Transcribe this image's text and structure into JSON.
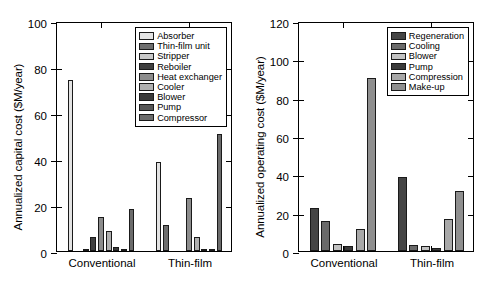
{
  "figure": {
    "panels": [
      "capital",
      "operating"
    ],
    "background": "#ffffff",
    "axis_color": "#000000"
  },
  "chart_data": [
    {
      "id": "capital",
      "type": "bar",
      "title": "",
      "xlabel": "",
      "ylabel": "Annualized capital cost ($M/year)",
      "ylim": [
        0,
        100
      ],
      "yticks": [
        0,
        20,
        40,
        60,
        80,
        100
      ],
      "grid": false,
      "legend_position": "top-right",
      "categories": [
        "Conventional",
        "Thin-film"
      ],
      "series": [
        {
          "name": "Absorber",
          "color": "#e3e3e3",
          "values": [
            74.5,
            38.5
          ]
        },
        {
          "name": "Thin-film unit",
          "color": "#6e6e6e",
          "values": [
            0,
            11.3
          ]
        },
        {
          "name": "Stripper",
          "color": "#c9c9c9",
          "values": [
            1.0,
            0
          ]
        },
        {
          "name": "Reboiler",
          "color": "#3f3f3f",
          "values": [
            5.9,
            0
          ]
        },
        {
          "name": "Heat exchanger",
          "color": "#8c8c8c",
          "values": [
            15.0,
            23.0
          ]
        },
        {
          "name": "Cooler",
          "color": "#b0b0b0",
          "values": [
            8.5,
            6.0
          ]
        },
        {
          "name": "Blower",
          "color": "#3a3a3a",
          "values": [
            1.8,
            1.0
          ]
        },
        {
          "name": "Pump",
          "color": "#565656",
          "values": [
            0.7,
            0.3
          ]
        },
        {
          "name": "Compressor",
          "color": "#6b6b6b",
          "values": [
            18.3,
            51.0
          ]
        }
      ]
    },
    {
      "id": "operating",
      "type": "bar",
      "title": "",
      "xlabel": "",
      "ylabel": "Annualized operating cost ($M/year)",
      "ylim": [
        0,
        120
      ],
      "yticks": [
        0,
        20,
        40,
        60,
        80,
        100,
        120
      ],
      "grid": false,
      "legend_position": "top-right",
      "categories": [
        "Conventional",
        "Thin-film"
      ],
      "series": [
        {
          "name": "Regeneration",
          "color": "#454545",
          "values": [
            22.5,
            38.7
          ]
        },
        {
          "name": "Cooling",
          "color": "#6a6a6a",
          "values": [
            15.8,
            3.3
          ]
        },
        {
          "name": "Blower",
          "color": "#c2c2c2",
          "values": [
            3.8,
            2.8
          ]
        },
        {
          "name": "Pump",
          "color": "#3a3a3a",
          "values": [
            2.8,
            1.4
          ]
        },
        {
          "name": "Compression",
          "color": "#a8a8a8",
          "values": [
            11.4,
            16.9
          ]
        },
        {
          "name": "Make-up",
          "color": "#8f8f8f",
          "values": [
            90.2,
            31.4
          ]
        }
      ]
    }
  ]
}
